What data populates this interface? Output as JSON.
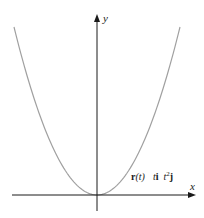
{
  "figure": {
    "curve": {
      "name": "parabola",
      "equation": "y = x^2",
      "color": "#a0a0a0"
    },
    "axes": {
      "x_label": "x",
      "y_label": "y",
      "color": "#1a1a1a"
    },
    "label": {
      "r": "r",
      "t_paren": "(t)",
      "term1": "t",
      "i": "i",
      "term2": "t",
      "exp": "2",
      "j": "j"
    }
  }
}
